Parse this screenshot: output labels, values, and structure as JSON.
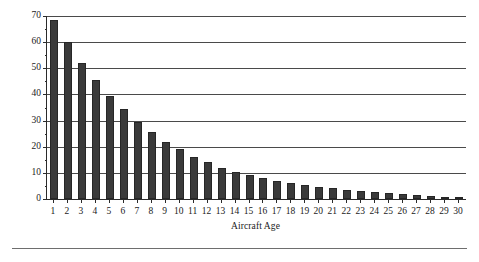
{
  "chart_data": {
    "type": "bar",
    "title": "",
    "xlabel": "Aircraft Age",
    "ylabel": "Value ($ millions)",
    "categories": [
      "1",
      "2",
      "3",
      "4",
      "5",
      "6",
      "7",
      "8",
      "9",
      "10",
      "11",
      "12",
      "13",
      "14",
      "15",
      "16",
      "17",
      "18",
      "19",
      "20",
      "21",
      "22",
      "23",
      "24",
      "25",
      "26",
      "27",
      "28",
      "29",
      "30"
    ],
    "values": [
      68.5,
      60.0,
      52.0,
      45.5,
      39.5,
      34.5,
      29.5,
      25.5,
      22.0,
      19.0,
      16.2,
      14.0,
      12.0,
      10.2,
      9.0,
      8.0,
      7.0,
      6.2,
      5.4,
      4.7,
      4.1,
      3.5,
      3.0,
      2.6,
      2.2,
      1.8,
      1.4,
      1.1,
      0.7,
      0.4
    ],
    "ylim": [
      0,
      70
    ],
    "xlim_categories": 30,
    "yticks": [
      0,
      10,
      20,
      30,
      40,
      50,
      60,
      70
    ],
    "ytick_labels": [
      "0",
      "10",
      "20",
      "30",
      "40",
      "50",
      "60",
      "70"
    ],
    "grid": "horizontal",
    "legend": "none",
    "bar_color": "#3a3a3a",
    "axis_color": "#2b2b2b",
    "grid_color": "#4a4a4a"
  }
}
